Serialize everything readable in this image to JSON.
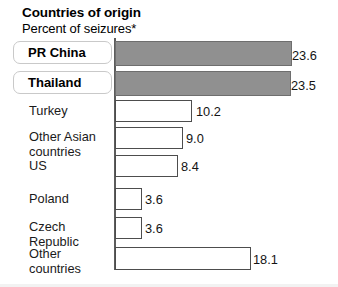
{
  "header": {
    "title": "Countries of origin",
    "subtitle": "Percent of seizures*"
  },
  "chart_data": {
    "type": "bar",
    "orientation": "horizontal",
    "title": "Countries of origin",
    "subtitle": "Percent of seizures*",
    "xlabel": "",
    "ylabel": "",
    "xlim": [
      0,
      24
    ],
    "grid": false,
    "legend": null,
    "value_format": "one-decimal",
    "categories": [
      "PR China",
      "Thailand",
      "Turkey",
      "Other Asian countries",
      "US",
      "Poland",
      "Czech Republic",
      "Other countries"
    ],
    "values": [
      23.6,
      23.5,
      10.2,
      9.0,
      8.4,
      3.6,
      3.6,
      18.1
    ],
    "value_labels": [
      "23.6",
      "23.5",
      "10.2",
      "9.0",
      "8.4",
      "3.6",
      "3.6",
      "18.1"
    ],
    "highlighted": [
      "PR China",
      "Thailand"
    ],
    "bar_fill_highlight": "#909090",
    "bar_fill_default": "#ffffff",
    "bar_stroke": "#4d4d4d",
    "axis_color": "#5c5c5c",
    "label_box_border": "#c9c9c9"
  },
  "bars": [
    {
      "label": "PR China",
      "label_line2": "",
      "value_label": "23.6",
      "style": "filled",
      "boxed": true,
      "label_top": 3,
      "bar_top": 3,
      "bar_height": 25,
      "bar_width": 177,
      "value_left": 292,
      "value_top": 10
    },
    {
      "label": "Thailand",
      "label_line2": "",
      "value_label": "23.5",
      "style": "filled",
      "boxed": true,
      "label_top": 33,
      "bar_top": 33,
      "bar_height": 25,
      "bar_width": 176,
      "value_left": 291,
      "value_top": 40
    },
    {
      "label": "Turkey",
      "label_line2": "",
      "value_label": "10.2",
      "style": "hollow",
      "boxed": false,
      "label_top": 65,
      "bar_top": 62,
      "bar_height": 22,
      "bar_width": 77,
      "value_left": 196,
      "value_top": 66
    },
    {
      "label": "Other Asian",
      "label_line2": "countries",
      "value_label": "9.0",
      "style": "hollow",
      "boxed": false,
      "label_top": 91,
      "bar_top": 89,
      "bar_height": 22,
      "bar_width": 68,
      "value_left": 186,
      "value_top": 93
    },
    {
      "label": "US",
      "label_line2": "",
      "value_label": "8.4",
      "style": "hollow",
      "boxed": false,
      "label_top": 120,
      "bar_top": 117,
      "bar_height": 22,
      "bar_width": 63,
      "value_left": 181,
      "value_top": 121
    },
    {
      "label": "Poland",
      "label_line2": "",
      "value_label": "3.6",
      "style": "hollow",
      "boxed": false,
      "label_top": 153,
      "bar_top": 150,
      "bar_height": 22,
      "bar_width": 27,
      "value_left": 145,
      "value_top": 154
    },
    {
      "label": "Czech",
      "label_line2": "Republic",
      "value_label": "3.6",
      "style": "hollow",
      "boxed": false,
      "label_top": 181,
      "bar_top": 179,
      "bar_height": 22,
      "bar_width": 27,
      "value_left": 145,
      "value_top": 183
    },
    {
      "label": "Other",
      "label_line2": "countries",
      "value_label": "18.1",
      "style": "hollow",
      "boxed": false,
      "label_top": 208,
      "bar_top": 209,
      "bar_height": 23,
      "bar_width": 136,
      "value_left": 253,
      "value_top": 214
    }
  ]
}
